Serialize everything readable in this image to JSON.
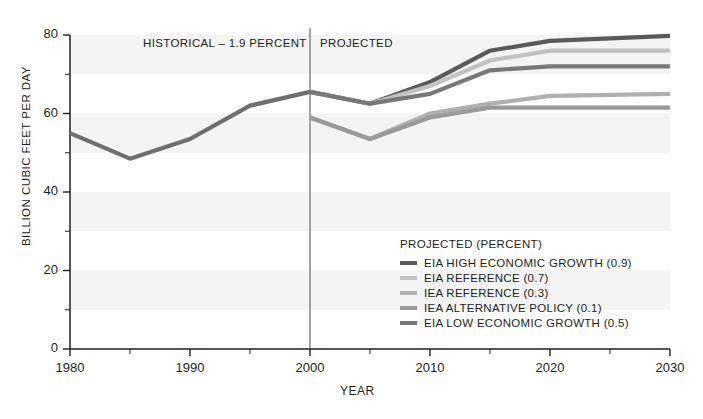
{
  "chart_data": {
    "type": "line",
    "title": "",
    "xlabel": "YEAR",
    "ylabel": "BILLION CUBIC FEET PER DAY",
    "xlim": [
      1980,
      2030
    ],
    "ylim": [
      0,
      80
    ],
    "ytick_labels": [
      "0",
      "20",
      "40",
      "60",
      "80"
    ],
    "ytick_values": [
      0,
      20,
      40,
      60,
      80
    ],
    "yminor_values": [
      10,
      30,
      50,
      70
    ],
    "xtick_labels": [
      "1980",
      "1990",
      "2000",
      "2010",
      "2020",
      "2030"
    ],
    "xtick_values": [
      1980,
      1990,
      2000,
      2010,
      2020,
      2030
    ],
    "xminor_values": [
      1985,
      1995,
      2005,
      2015,
      2025
    ],
    "grid": "horizontal-banded",
    "legend_position": "inside-lower-right",
    "divider_year": 2000,
    "annotations": [
      {
        "text": "HISTORICAL – 1.9 PERCENT",
        "x": 1993.5,
        "y": 77.5
      },
      {
        "text": "PROJECTED",
        "x": 2001.5,
        "y": 77.5
      }
    ],
    "legend_title": "PROJECTED (PERCENT)",
    "series": [
      {
        "name": "HISTORICAL",
        "label": "HISTORICAL – 1.9 PERCENT",
        "color": "#6f6f6f",
        "width": 4.2,
        "in_legend": false,
        "x": [
          1980,
          1985,
          1990,
          1995,
          2000
        ],
        "values": [
          55.0,
          48.5,
          53.5,
          62.0,
          65.5
        ]
      },
      {
        "name": "EIA HIGH ECONOMIC GROWTH (0.9)",
        "color": "#5a5a5a",
        "width": 4.2,
        "in_legend": true,
        "x": [
          2000,
          2005,
          2010,
          2015,
          2020,
          2030
        ],
        "values": [
          65.5,
          62.5,
          68.0,
          76.0,
          78.5,
          79.8
        ]
      },
      {
        "name": "EIA REFERENCE (0.7)",
        "color": "#c2c2c2",
        "width": 4.2,
        "in_legend": true,
        "x": [
          2000,
          2005,
          2010,
          2015,
          2020,
          2030
        ],
        "values": [
          65.5,
          62.5,
          67.0,
          73.5,
          76.0,
          76.0
        ]
      },
      {
        "name": "IEA REFERENCE (0.3)",
        "color": "#b0b0b0",
        "width": 4.2,
        "in_legend": true,
        "x": [
          2000,
          2005,
          2010,
          2015,
          2020,
          2030
        ],
        "values": [
          59.0,
          53.5,
          60.0,
          62.5,
          64.5,
          65.0
        ]
      },
      {
        "name": "IEA ALTERNATIVE POLICY (0.1)",
        "color": "#9a9a9a",
        "width": 4.2,
        "in_legend": true,
        "x": [
          2000,
          2005,
          2010,
          2015,
          2020,
          2030
        ],
        "values": [
          59.0,
          53.5,
          59.0,
          61.5,
          61.5,
          61.5
        ]
      },
      {
        "name": "EIA LOW ECONOMIC GROWTH (0.5)",
        "color": "#787878",
        "width": 4.2,
        "in_legend": true,
        "x": [
          2000,
          2005,
          2010,
          2015,
          2020,
          2030
        ],
        "values": [
          65.5,
          62.5,
          65.0,
          71.0,
          72.0,
          72.0
        ]
      }
    ]
  },
  "colors": {
    "axis": "#231f20",
    "band": "#f4f4f4",
    "divider": "#6a6a6a",
    "text": "#231f20"
  }
}
